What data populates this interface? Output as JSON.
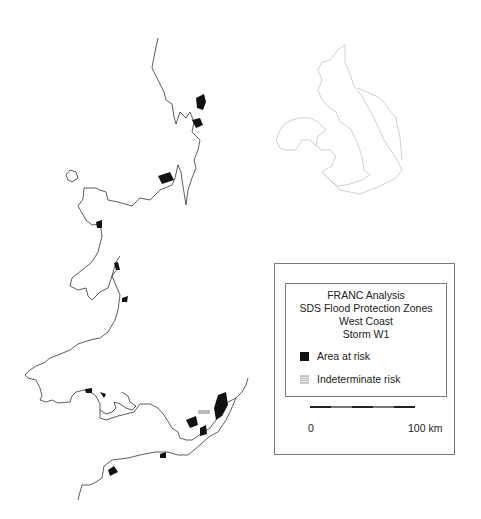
{
  "legend": {
    "title_lines": [
      "FRANC  Analysis",
      "SDS  Flood  Protection  Zones",
      "West Coast",
      "Storm   W1"
    ],
    "items": [
      {
        "label": "Area  at risk",
        "swatch": "solid-black"
      },
      {
        "label": "Indeterminate  risk",
        "swatch": "stippled-grey"
      }
    ]
  },
  "scale": {
    "start_label": "0",
    "end_label": "100  km"
  },
  "inset": {
    "description": "Outline map of British Isles with highlighted west coast"
  }
}
